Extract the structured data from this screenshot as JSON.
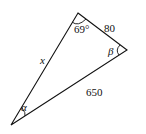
{
  "diagram": {
    "type": "triangle",
    "vertices": {
      "top": {
        "x": 78,
        "y": 13
      },
      "right": {
        "x": 127,
        "y": 50
      },
      "bottom_left": {
        "x": 11,
        "y": 125
      }
    },
    "labels": {
      "angle_top": "69°",
      "side_top_right": "80",
      "angle_right": "β",
      "side_left": "x",
      "side_bottom": "650",
      "angle_bottom_left": "α"
    },
    "stroke_color": "#111111"
  }
}
